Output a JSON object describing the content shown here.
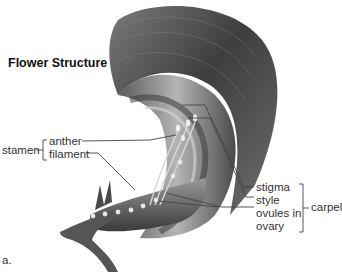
{
  "figure": {
    "title": "Flower Structure",
    "panel_label": "a."
  },
  "labels": {
    "stamen": {
      "group": "stamen",
      "parts": [
        "anther",
        "filament"
      ]
    },
    "carpel": {
      "group": "carpel",
      "parts": [
        "stigma",
        "style",
        "ovules in",
        "ovary"
      ]
    }
  },
  "colors": {
    "text": "#333333",
    "line": "#444444",
    "petal_dark": "#4a4a4a",
    "petal_light": "#9a9a9a",
    "background": "#ffffff"
  }
}
